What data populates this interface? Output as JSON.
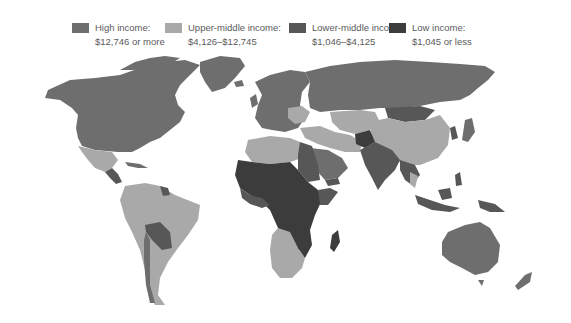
{
  "legend": {
    "items": [
      {
        "label": "High income:",
        "range": "$12,746 or more",
        "color": "#6e6e6e"
      },
      {
        "label": "Upper-middle income:",
        "range": "$4,126–$12,745",
        "color": "#a9a9a9"
      },
      {
        "label": "Lower-middle income:",
        "range": "$1,046–$4,125",
        "color": "#575757"
      },
      {
        "label": "Low income:",
        "range": "$1,045 or less",
        "color": "#3c3c3c"
      }
    ]
  },
  "map": {
    "type": "choropleth world map",
    "categories": [
      "High income",
      "Upper-middle income",
      "Lower-middle income",
      "Low income"
    ],
    "colors": {
      "high": "#6e6e6e",
      "upper_middle": "#a9a9a9",
      "lower_middle": "#575757",
      "low": "#3c3c3c"
    }
  }
}
